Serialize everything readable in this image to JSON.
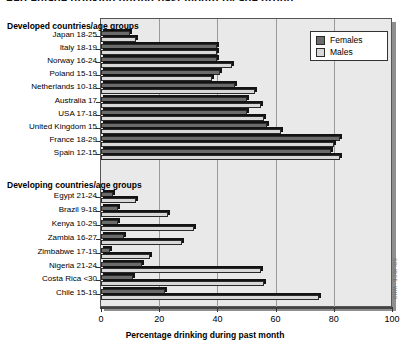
{
  "top_sliver_text": "Percentage drinking during past month by age group",
  "legend": {
    "items": [
      {
        "label": "Females",
        "color": "#6b6b6b",
        "key": "females"
      },
      {
        "label": "Males",
        "color": "#d8d8d8",
        "key": "males"
      }
    ]
  },
  "groups": [
    {
      "header": "Developed countries/age groups"
    },
    {
      "header": "Developing countries/age groups"
    }
  ],
  "axis": {
    "title": "Percentage drinking during past month",
    "ticks": [
      0,
      20,
      40,
      60,
      80,
      100
    ],
    "min": 0,
    "max": 100
  },
  "credit": "SOURCE: WHO",
  "chart_data": {
    "type": "bar",
    "orientation": "horizontal",
    "title": "Percentage drinking during past month by age group",
    "xlabel": "Percentage drinking during past month",
    "ylabel": "",
    "xlim": [
      0,
      100
    ],
    "grid": true,
    "legend_position": "top-right",
    "group_labels": [
      "Developed countries/age groups",
      "Developing countries/age groups"
    ],
    "categories": [
      "Japan 18-25",
      "Italy 18-19",
      "Norway 16-24",
      "Poland 15-19",
      "Netherlands 10-18",
      "Australia 17",
      "USA 17-18",
      "United Kingdom 15",
      "France 18-29",
      "Spain 12-15",
      "Egypt 21-24",
      "Brazil 9-18",
      "Kenya 10-29",
      "Zambia 16-27",
      "Zimbabwe 17-19",
      "Nigeria 21-24",
      "Costa Rica <30",
      "Chile 15-19"
    ],
    "category_groups": [
      "Developed",
      "Developed",
      "Developed",
      "Developed",
      "Developed",
      "Developed",
      "Developed",
      "Developed",
      "Developed",
      "Developed",
      "Developing",
      "Developing",
      "Developing",
      "Developing",
      "Developing",
      "Developing",
      "Developing",
      "Developing"
    ],
    "series": [
      {
        "name": "Females",
        "color": "#6b6b6b",
        "values": [
          10,
          40,
          40,
          41,
          46,
          50,
          50,
          57,
          82,
          79,
          4,
          6,
          6,
          8,
          3,
          14,
          11,
          22
        ]
      },
      {
        "name": "Males",
        "color": "#d8d8d8",
        "values": [
          12,
          40,
          45,
          38,
          53,
          55,
          56,
          62,
          80,
          82,
          12,
          23,
          32,
          28,
          17,
          55,
          56,
          75
        ]
      }
    ]
  }
}
